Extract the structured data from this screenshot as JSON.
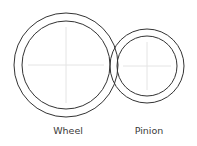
{
  "diagram": {
    "stroke_color": "#333333",
    "crosshair_color": "#e4e4e4",
    "gears": [
      {
        "id": "wheel",
        "label": "Wheel",
        "cx": 66,
        "cy": 65,
        "outer_r": 52,
        "inner_r": 44,
        "label_x": 68,
        "label_y": 134
      },
      {
        "id": "pinion",
        "label": "Pinion",
        "cx": 147,
        "cy": 66,
        "outer_r": 37,
        "inner_r": 30,
        "label_x": 149,
        "label_y": 134
      }
    ]
  }
}
